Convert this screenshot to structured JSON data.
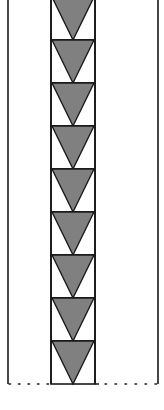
{
  "diagram": {
    "triangle_count": 9,
    "colors": {
      "background": "#ffffff",
      "stroke": "#1a1a1a",
      "triangle_fill": "#808080"
    },
    "geometry": {
      "outer_left_x": 8,
      "outer_right_x": 158,
      "strip_left_x": 51,
      "strip_right_x": 95,
      "first_top_y": -3,
      "unit_height": 43,
      "baseline_y": 384
    }
  }
}
